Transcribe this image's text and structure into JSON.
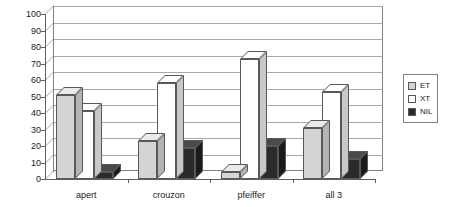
{
  "chart_data": {
    "type": "bar",
    "title": "",
    "xlabel": "",
    "ylabel": "",
    "ylim": [
      0,
      100
    ],
    "ytick_step": 10,
    "yticks": [
      0,
      10,
      20,
      30,
      40,
      50,
      60,
      70,
      80,
      90,
      100
    ],
    "grid": true,
    "legend_position": "right",
    "three_d": true,
    "categories": [
      "apert",
      "crouzon",
      "pfeiffer",
      "all 3"
    ],
    "series": [
      {
        "name": "ET",
        "color": "#d4d4d4",
        "values": [
          51,
          23,
          4,
          31
        ]
      },
      {
        "name": "XT",
        "color": "#ffffff",
        "values": [
          41,
          58,
          73,
          53
        ]
      },
      {
        "name": "NIL",
        "color": "#2b2b2b",
        "values": [
          4,
          19,
          20,
          12
        ]
      }
    ]
  },
  "legend": {
    "items": [
      {
        "label": "ET",
        "swatch": "swatch-et-icon"
      },
      {
        "label": "XT",
        "swatch": "swatch-xt-icon"
      },
      {
        "label": "NIL",
        "swatch": "swatch-nil-icon"
      }
    ]
  }
}
